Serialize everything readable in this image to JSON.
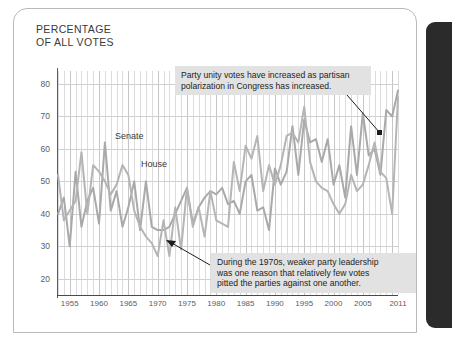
{
  "title": "PERCENTAGE\nOF ALL VOTES",
  "series_labels": {
    "senate": "Senate",
    "house": "House"
  },
  "annotations": {
    "top": "Party unity votes have increased as partisan\npolarization in Congress has increased.",
    "bottom": "During the 1970s, weaker party leadership\nwas one reason that relatively few votes\npitted the parties against one another."
  },
  "colors": {
    "line": "#a9a9a9",
    "line_alt": "#b5b5b5",
    "annotation_bg": "#e2e2e2",
    "grid": "#dcdcdc",
    "axis": "#4a4a4a",
    "panel": "#2b2b2b"
  },
  "chart_data": {
    "type": "line",
    "title": "PERCENTAGE OF ALL VOTES",
    "xlabel": "",
    "ylabel": "PERCENTAGE OF ALL VOTES",
    "xlim": [
      1953,
      2011
    ],
    "ylim": [
      15,
      84
    ],
    "yticks": [
      20,
      30,
      40,
      50,
      60,
      70,
      80
    ],
    "xticks": [
      1955,
      1960,
      1965,
      1970,
      1975,
      1980,
      1985,
      1990,
      1995,
      2000,
      2005,
      2011
    ],
    "grid": true,
    "legend": "inline-labels",
    "x": [
      1953,
      1954,
      1955,
      1956,
      1957,
      1958,
      1959,
      1960,
      1961,
      1962,
      1963,
      1964,
      1965,
      1966,
      1967,
      1968,
      1969,
      1970,
      1971,
      1972,
      1973,
      1974,
      1975,
      1976,
      1977,
      1978,
      1979,
      1980,
      1981,
      1982,
      1983,
      1984,
      1985,
      1986,
      1987,
      1988,
      1989,
      1990,
      1991,
      1992,
      1993,
      1994,
      1995,
      1996,
      1997,
      1998,
      1999,
      2000,
      2001,
      2002,
      2003,
      2004,
      2005,
      2006,
      2007,
      2008,
      2009,
      2010,
      2011
    ],
    "series": [
      {
        "name": "Senate",
        "values": [
          40,
          45,
          30,
          53,
          36,
          44,
          48,
          37,
          62,
          41,
          47,
          36,
          42,
          50,
          35,
          50,
          36,
          35,
          35,
          36,
          40,
          44,
          48,
          37,
          42,
          45,
          47,
          46,
          48,
          43,
          44,
          40,
          50,
          52,
          41,
          42,
          35,
          54,
          49,
          53,
          67,
          52,
          69,
          62,
          63,
          56,
          63,
          49,
          55,
          45,
          67,
          52,
          71,
          58,
          60,
          52,
          72,
          70,
          78
        ],
        "color": "#a9a9a9"
      },
      {
        "name": "House",
        "values": [
          52,
          38,
          41,
          44,
          59,
          40,
          55,
          53,
          50,
          46,
          49,
          55,
          52,
          41,
          36,
          33,
          31,
          27,
          38,
          27,
          42,
          29,
          48,
          36,
          42,
          33,
          47,
          38,
          37,
          36,
          56,
          47,
          61,
          57,
          64,
          47,
          55,
          49,
          55,
          64,
          65,
          62,
          73,
          56,
          50,
          48,
          47,
          43,
          40,
          43,
          52,
          47,
          49,
          55,
          62,
          53,
          51,
          40,
          76
        ],
        "color": "#b5b5b5"
      }
    ]
  }
}
